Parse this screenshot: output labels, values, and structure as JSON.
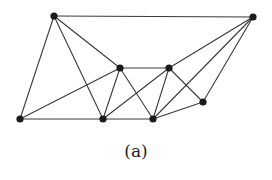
{
  "figure": {
    "caption": "(a)",
    "colors": {
      "edge": "#3a3a3a",
      "node": "#1a1a1a",
      "background": "#ffffff"
    },
    "node_radius": 3.6,
    "nodes": [
      {
        "id": "A",
        "x": 54,
        "y": 16
      },
      {
        "id": "B",
        "x": 253,
        "y": 17
      },
      {
        "id": "C",
        "x": 120,
        "y": 68
      },
      {
        "id": "D",
        "x": 169,
        "y": 68
      },
      {
        "id": "E",
        "x": 20,
        "y": 119
      },
      {
        "id": "F",
        "x": 103,
        "y": 119
      },
      {
        "id": "G",
        "x": 153,
        "y": 119
      },
      {
        "id": "H",
        "x": 203,
        "y": 102
      }
    ],
    "edges": [
      [
        "A",
        "B"
      ],
      [
        "A",
        "E"
      ],
      [
        "A",
        "F"
      ],
      [
        "A",
        "C"
      ],
      [
        "E",
        "C"
      ],
      [
        "E",
        "F"
      ],
      [
        "C",
        "D"
      ],
      [
        "C",
        "F"
      ],
      [
        "C",
        "G"
      ],
      [
        "D",
        "F"
      ],
      [
        "D",
        "G"
      ],
      [
        "D",
        "H"
      ],
      [
        "D",
        "B"
      ],
      [
        "F",
        "G"
      ],
      [
        "G",
        "H"
      ],
      [
        "G",
        "B"
      ],
      [
        "H",
        "B"
      ]
    ]
  }
}
